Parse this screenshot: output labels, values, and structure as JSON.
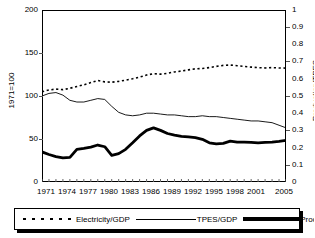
{
  "chart_data": {
    "type": "line",
    "title": "",
    "xlabel": "",
    "ylabel": "1971=100",
    "y2label": "Production/TPES",
    "grid": false,
    "legend_position": "bottom",
    "xlim": [
      1971,
      2006
    ],
    "ylim": [
      0,
      200
    ],
    "y2lim": [
      0,
      1
    ],
    "x": [
      1971,
      1972,
      1973,
      1974,
      1975,
      1976,
      1977,
      1978,
      1979,
      1980,
      1981,
      1982,
      1983,
      1984,
      1985,
      1986,
      1987,
      1988,
      1989,
      1990,
      1991,
      1992,
      1993,
      1994,
      1995,
      1996,
      1997,
      1998,
      1999,
      2000,
      2001,
      2002,
      2003,
      2004,
      2005,
      2006
    ],
    "xticks": [
      "1971",
      "1974",
      "1977",
      "1980",
      "1983",
      "1986",
      "1989",
      "1992",
      "1995",
      "1998",
      "2001",
      "2005"
    ],
    "yticks": [
      "0",
      "50",
      "100",
      "150",
      "200"
    ],
    "y2ticks": [
      "0",
      "0.1",
      "0.2",
      "0.3",
      "0.4",
      "0.5",
      "0.6",
      "0.7",
      "0.8",
      "0.9",
      "1"
    ],
    "series": [
      {
        "name": "Electricity/GDP",
        "axis": "right",
        "style": "dotted",
        "values": [
          0.525,
          0.535,
          0.54,
          0.537,
          0.545,
          0.555,
          0.565,
          0.578,
          0.59,
          0.582,
          0.58,
          0.585,
          0.592,
          0.6,
          0.61,
          0.622,
          0.63,
          0.627,
          0.632,
          0.64,
          0.645,
          0.652,
          0.658,
          0.66,
          0.665,
          0.672,
          0.678,
          0.68,
          0.676,
          0.672,
          0.668,
          0.665,
          0.663,
          0.665,
          0.663,
          0.662
        ]
      },
      {
        "name": "TPES/GDP",
        "axis": "left",
        "style": "thin",
        "values": [
          100,
          103,
          104,
          101,
          95,
          93,
          93,
          95,
          97,
          96,
          88,
          81,
          78,
          77,
          78,
          80,
          80,
          79,
          78,
          78,
          77,
          76,
          76,
          77,
          76,
          76,
          75,
          74,
          73,
          72,
          71,
          71,
          70,
          69,
          66,
          63
        ]
      },
      {
        "name": "Production/TPES",
        "axis": "right",
        "style": "thick",
        "values": [
          0.175,
          0.16,
          0.148,
          0.14,
          0.143,
          0.19,
          0.196,
          0.203,
          0.215,
          0.205,
          0.155,
          0.165,
          0.19,
          0.228,
          0.268,
          0.3,
          0.315,
          0.3,
          0.282,
          0.272,
          0.265,
          0.262,
          0.258,
          0.248,
          0.228,
          0.222,
          0.225,
          0.238,
          0.232,
          0.232,
          0.23,
          0.228,
          0.23,
          0.232,
          0.236,
          0.242
        ]
      }
    ]
  },
  "axes": {
    "left_title": "1971=100",
    "right_title": "Production/TPES"
  },
  "legend": {
    "items": [
      {
        "label": "Electricity/GDP",
        "swatch": "dotted-line-swatch"
      },
      {
        "label": "TPES/GDP",
        "swatch": "thin-line-swatch"
      },
      {
        "label": "Production/TPES",
        "swatch": "thick-line-swatch"
      }
    ]
  }
}
